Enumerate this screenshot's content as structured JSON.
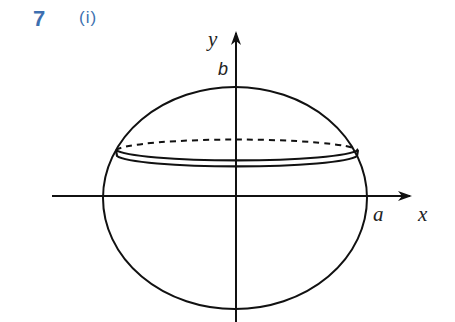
{
  "header": {
    "question_number": "7",
    "part_label": "(i)"
  },
  "figure": {
    "labels": {
      "y_axis": "y",
      "x_axis": "x",
      "b_intercept": "b",
      "a_intercept": "a"
    },
    "colors": {
      "accent": "#3d6fb0",
      "stroke": "#111111",
      "background": "#ffffff"
    }
  }
}
